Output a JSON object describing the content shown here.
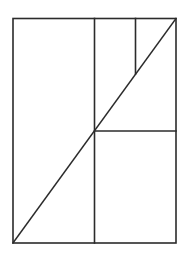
{
  "diagram": {
    "stroke_color": "#2b2b2b",
    "background_color": "#ffffff",
    "outer_rect": {
      "x1": 13,
      "y1": 18.5,
      "x2": 176,
      "y2": 243
    },
    "lines": [
      {
        "name": "vertical-divider-main",
        "x1": 94.5,
        "y1": 18.5,
        "x2": 94.5,
        "y2": 243
      },
      {
        "name": "horizontal-divider-right",
        "x1": 94.5,
        "y1": 131,
        "x2": 176,
        "y2": 131
      },
      {
        "name": "vertical-divider-upper",
        "x1": 135.5,
        "y1": 18.5,
        "x2": 135.5,
        "y2": 74
      },
      {
        "name": "diagonal",
        "x1": 13,
        "y1": 243,
        "x2": 176,
        "y2": 18.5
      }
    ]
  }
}
